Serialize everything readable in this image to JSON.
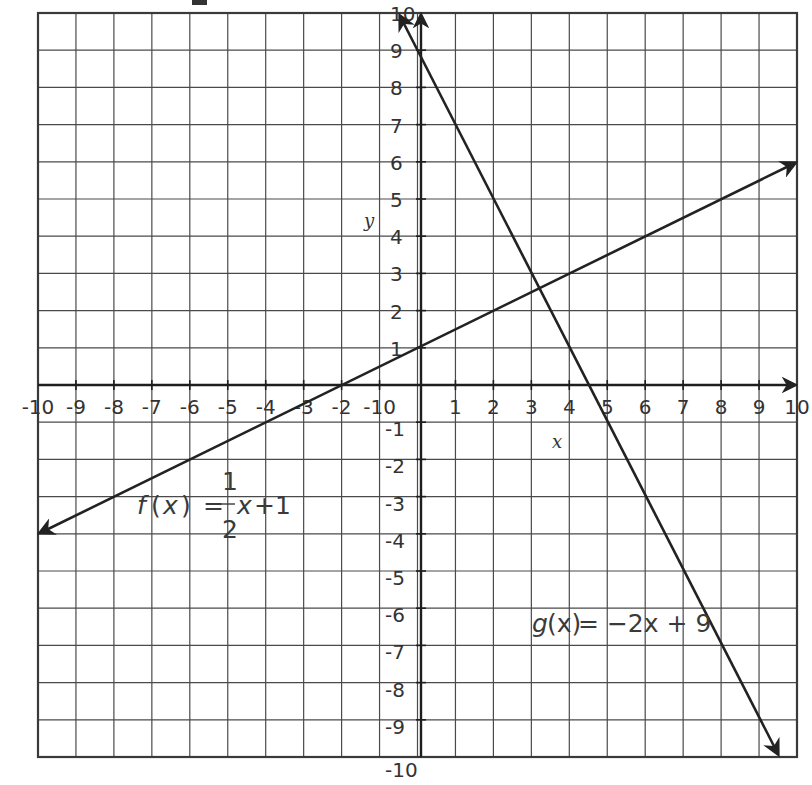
{
  "chart_data": {
    "type": "line",
    "title": "",
    "xlabel": "x",
    "ylabel": "y",
    "xlim": [
      -10,
      10
    ],
    "ylim": [
      -10,
      10
    ],
    "grid": true,
    "x_tick_labels": [
      "-10",
      "-9",
      "-8",
      "-7",
      "-6",
      "-5",
      "-4",
      "-3",
      "-2",
      "-10",
      "1",
      "2",
      "3",
      "4",
      "5",
      "6",
      "7",
      "8",
      "9",
      "10"
    ],
    "y_tick_labels_positive": [
      "1",
      "2",
      "3",
      "4",
      "5",
      "6",
      "7",
      "8",
      "9",
      "10"
    ],
    "y_tick_labels_negative": [
      "-1",
      "-2",
      "-3",
      "-4",
      "-5",
      "-6",
      "-7",
      "-8",
      "-9",
      "-10"
    ],
    "series": [
      {
        "name": "f(x) = 1/2 x + 1",
        "slope": 0.5,
        "intercept": 1,
        "x": [
          -10,
          10
        ],
        "values": [
          -4,
          6
        ],
        "arrows": "both"
      },
      {
        "name": "g(x) = -2x + 9",
        "slope": -2,
        "intercept": 9,
        "x": [
          0.5,
          9.5
        ],
        "values": [
          8,
          -10
        ],
        "arrows": "both"
      }
    ],
    "intersection": {
      "x": 3.2,
      "y": 2.6
    },
    "annotations": [
      {
        "text": "f(x) = 1/2 x + 1",
        "near": [
          -5,
          -3
        ]
      },
      {
        "text": "g(x) = -2x + 9",
        "near": [
          5.5,
          -6.6
        ]
      }
    ]
  },
  "labels": {
    "x_axis": "x",
    "y_axis": "y",
    "f_name": "f",
    "f_open": "(",
    "f_var": "x",
    "f_close": ")",
    "f_eq": "=",
    "f_num": "1",
    "f_den": "2",
    "f_rest_var": "x",
    "f_rest": "+1",
    "g_name": "g",
    "g_paren": "(x)",
    "g_rest": " = −2x + 9"
  }
}
